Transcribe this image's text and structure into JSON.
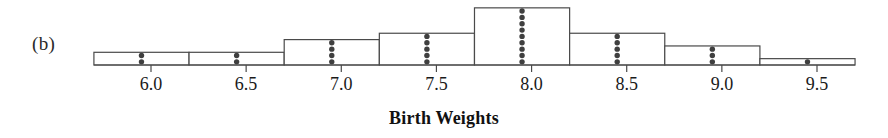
{
  "panel": {
    "label": "(b)"
  },
  "chart_data": {
    "type": "bar",
    "title": "",
    "subtitle": "",
    "xlabel": "Birth Weights",
    "ylabel": "",
    "grid": false,
    "legend": null,
    "orientation": "vertical",
    "xlim": [
      5.7,
      10.1
    ],
    "ylim": [
      0,
      9
    ],
    "bin_width": 0.5,
    "bin_edges": [
      5.7,
      6.2,
      6.7,
      7.2,
      7.7,
      8.2,
      8.7,
      9.2,
      9.7
    ],
    "categories": [
      "5.7-6.2",
      "6.2-6.7",
      "6.7-7.2",
      "7.2-7.7",
      "7.7-8.2",
      "8.2-8.7",
      "8.7-9.2",
      "9.2-9.7"
    ],
    "values": [
      2,
      2,
      4,
      5,
      9,
      5,
      3,
      1
    ],
    "dot_centers": [
      5.95,
      6.45,
      6.95,
      7.45,
      7.95,
      8.45,
      8.95,
      9.45
    ],
    "total_count": 31,
    "xticks": [
      6.0,
      6.5,
      7.0,
      7.5,
      8.0,
      8.5,
      9.0,
      9.5
    ],
    "xticklabels": [
      "6.0",
      "6.5",
      "7.0",
      "7.5",
      "8.0",
      "8.5",
      "9.0",
      "9.5"
    ],
    "colors": {
      "bar_stroke": "#4a4a4a",
      "bar_fill": "#ffffff",
      "dot": "#3f3f3f",
      "axis": "#4a4a4a",
      "text": "#1a1a1a"
    }
  }
}
